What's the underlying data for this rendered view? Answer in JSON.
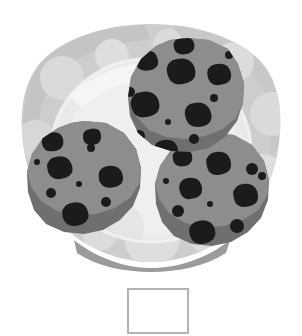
{
  "scene": {
    "title": "Three chocolate chip cookies on a white polka-dot plate",
    "width": 302,
    "height": 336,
    "background_color": "#ffffff"
  },
  "palette": {
    "background": "#ffffff",
    "plate_rim": "#cdcdcd",
    "plate_rim_shade": "#bdbdbd",
    "plate_well": "#e3e3e3",
    "plate_well_light": "#ededed",
    "plate_highlight": "#f2f2f2",
    "plate_base": "#a6a6a6",
    "plate_base_shadow": "#9a9a9a",
    "polka_dot": "#d9d9d9",
    "cookie_top": "#8c8c8c",
    "cookie_edge": "#6e6e6e",
    "chocolate_chip": "#1a1a1a"
  },
  "plate": {
    "name": "white polka dot plate",
    "rim_color": "#cdcdcd",
    "well_color": "#e8e8e8",
    "dot_color": "#d6d6d6",
    "dot_count": 9,
    "dots": [
      {
        "cx": 62,
        "cy": 78,
        "r": 22
      },
      {
        "cx": 112,
        "cy": 58,
        "r": 17
      },
      {
        "cx": 168,
        "cy": 48,
        "r": 15
      },
      {
        "cx": 232,
        "cy": 64,
        "r": 20
      },
      {
        "cx": 268,
        "cy": 112,
        "r": 22
      },
      {
        "cx": 258,
        "cy": 176,
        "r": 24
      },
      {
        "cx": 40,
        "cy": 140,
        "r": 20
      },
      {
        "cx": 58,
        "cy": 198,
        "r": 22
      },
      {
        "cx": 150,
        "cy": 236,
        "r": 26
      }
    ]
  },
  "cookies": [
    {
      "id": "cookie-top",
      "label": "top chocolate chip cookie",
      "center": [
        187,
        95
      ],
      "radius": 57,
      "top_color": "#8c8c8c",
      "edge_color": "#6e6e6e",
      "chip_count": 13,
      "chips": [
        {
          "cx": 185,
          "cy": 44,
          "r": 6
        },
        {
          "cx": 147,
          "cy": 59,
          "r": 8
        },
        {
          "cx": 181,
          "cy": 71,
          "r": 12
        },
        {
          "cx": 219,
          "cy": 74,
          "r": 9
        },
        {
          "cx": 130,
          "cy": 92,
          "r": 5
        },
        {
          "cx": 145,
          "cy": 103,
          "r": 11
        },
        {
          "cx": 197,
          "cy": 114,
          "r": 11
        },
        {
          "cx": 168,
          "cy": 122,
          "r": 3
        },
        {
          "cx": 139,
          "cy": 136,
          "r": 6
        },
        {
          "cx": 194,
          "cy": 139,
          "r": 5
        },
        {
          "cx": 166,
          "cy": 149,
          "r": 9
        },
        {
          "cx": 228,
          "cy": 54,
          "r": 4
        },
        {
          "cx": 213,
          "cy": 98,
          "r": 4
        }
      ]
    },
    {
      "id": "cookie-left",
      "label": "lower-left chocolate chip cookie",
      "center": [
        84,
        178
      ],
      "radius": 57,
      "top_color": "#8c8c8c",
      "edge_color": "#6e6e6e",
      "chip_count": 12,
      "chips": [
        {
          "cx": 96,
          "cy": 136,
          "r": 7
        },
        {
          "cx": 56,
          "cy": 139,
          "r": 7
        },
        {
          "cx": 90,
          "cy": 147,
          "r": 4
        },
        {
          "cx": 38,
          "cy": 163,
          "r": 3
        },
        {
          "cx": 60,
          "cy": 168,
          "r": 11
        },
        {
          "cx": 109,
          "cy": 177,
          "r": 11
        },
        {
          "cx": 79,
          "cy": 184,
          "r": 3
        },
        {
          "cx": 51,
          "cy": 193,
          "r": 5
        },
        {
          "cx": 105,
          "cy": 203,
          "r": 5
        },
        {
          "cx": 74,
          "cy": 213,
          "r": 10
        },
        {
          "cx": 124,
          "cy": 155,
          "r": 4
        },
        {
          "cx": 98,
          "cy": 120,
          "r": 4
        }
      ]
    },
    {
      "id": "cookie-right",
      "label": "lower-right chocolate chip cookie",
      "center": [
        212,
        190
      ],
      "radius": 57,
      "top_color": "#8c8c8c",
      "edge_color": "#6e6e6e",
      "chip_count": 13,
      "chips": [
        {
          "cx": 218,
          "cy": 164,
          "r": 11
        },
        {
          "cx": 184,
          "cy": 157,
          "r": 7
        },
        {
          "cx": 251,
          "cy": 170,
          "r": 6
        },
        {
          "cx": 167,
          "cy": 182,
          "r": 3
        },
        {
          "cx": 190,
          "cy": 188,
          "r": 10
        },
        {
          "cx": 245,
          "cy": 196,
          "r": 11
        },
        {
          "cx": 210,
          "cy": 204,
          "r": 3
        },
        {
          "cx": 178,
          "cy": 211,
          "r": 6
        },
        {
          "cx": 236,
          "cy": 226,
          "r": 7
        },
        {
          "cx": 201,
          "cy": 232,
          "r": 10
        },
        {
          "cx": 262,
          "cy": 176,
          "r": 4
        },
        {
          "cx": 175,
          "cy": 146,
          "r": 4
        },
        {
          "cx": 256,
          "cy": 213,
          "r": 4
        }
      ]
    }
  ],
  "caption_box": {
    "name": "empty caption box",
    "text": "",
    "border_color": "#b3b3b3",
    "fill_color": "#ffffff",
    "x": 127,
    "y": 288,
    "width": 62,
    "height": 46
  }
}
